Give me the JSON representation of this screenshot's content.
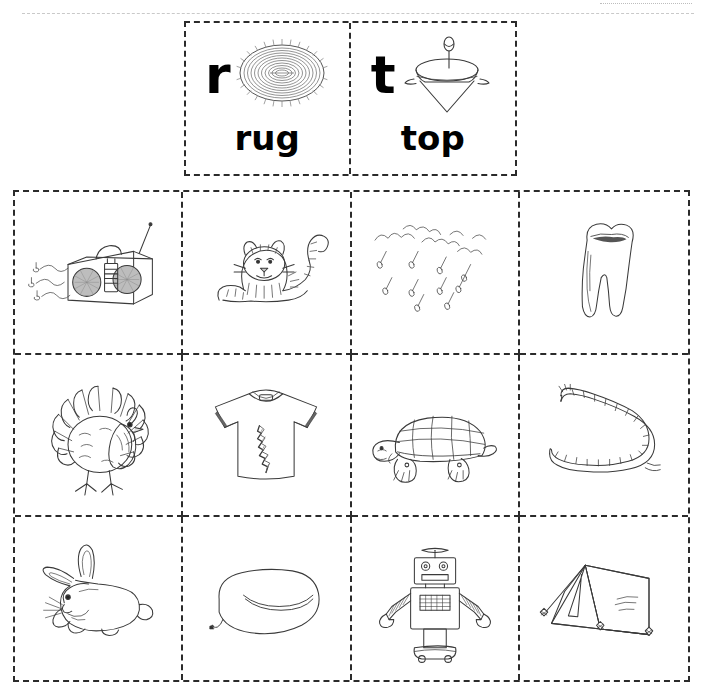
{
  "worksheet": {
    "title": "Beginning Sounds Cut and Paste",
    "type": "phonics-picture-sort"
  },
  "key_cards": [
    {
      "letter": "r",
      "word": "rug",
      "icon": "braided-oval-rug-icon"
    },
    {
      "letter": "t",
      "word": "top",
      "icon": "spinning-top-icon"
    }
  ],
  "grid": {
    "columns": 4,
    "rows": 3,
    "cells": [
      {
        "row": 1,
        "col": 1,
        "icon": "radio-icon",
        "word": "radio",
        "sound": "r"
      },
      {
        "row": 1,
        "col": 2,
        "icon": "tiger-icon",
        "word": "tiger",
        "sound": "t"
      },
      {
        "row": 1,
        "col": 3,
        "icon": "rain-icon",
        "word": "rain",
        "sound": "r"
      },
      {
        "row": 1,
        "col": 4,
        "icon": "tooth-icon",
        "word": "tooth",
        "sound": "t"
      },
      {
        "row": 2,
        "col": 1,
        "icon": "turkey-icon",
        "word": "turkey",
        "sound": "t"
      },
      {
        "row": 2,
        "col": 2,
        "icon": "ripped-shirt-icon",
        "word": "rip",
        "sound": "r"
      },
      {
        "row": 2,
        "col": 3,
        "icon": "turtle-icon",
        "word": "turtle",
        "sound": "t"
      },
      {
        "row": 2,
        "col": 4,
        "icon": "rope-icon",
        "word": "rope",
        "sound": "r"
      },
      {
        "row": 3,
        "col": 1,
        "icon": "rabbit-icon",
        "word": "rabbit",
        "sound": "r"
      },
      {
        "row": 3,
        "col": 2,
        "icon": "inner-tube-icon",
        "word": "tube",
        "sound": "t"
      },
      {
        "row": 3,
        "col": 3,
        "icon": "robot-icon",
        "word": "robot",
        "sound": "r"
      },
      {
        "row": 3,
        "col": 4,
        "icon": "tent-icon",
        "word": "tent",
        "sound": "t"
      }
    ]
  },
  "colors": {
    "ink": "#3a3a3a",
    "cut_line": "#2b2b2b",
    "text": "#000000",
    "paper": "#ffffff"
  }
}
